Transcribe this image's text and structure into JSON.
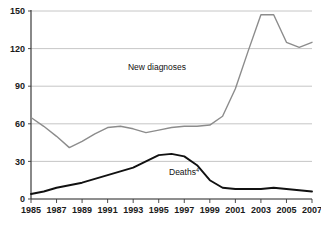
{
  "chart_data": {
    "type": "line",
    "title": "",
    "subtitle": "",
    "xlabel": "",
    "ylabel": "",
    "xlim": [
      1985,
      2007
    ],
    "ylim": [
      0,
      150
    ],
    "grid": true,
    "legend_position": "inline-annotations",
    "y_ticks": [
      0,
      30,
      60,
      90,
      120,
      150
    ],
    "y_tick_labels": [
      "0",
      "30",
      "60",
      "90",
      "120",
      "150"
    ],
    "x_ticks": [
      1985,
      1987,
      1989,
      1991,
      1993,
      1995,
      1997,
      1999,
      2001,
      2003,
      2005,
      2007
    ],
    "x_tick_labels": [
      "1985",
      "1987",
      "1989",
      "1991",
      "1993",
      "1995",
      "1997",
      "1999",
      "2001",
      "2003",
      "2005",
      "2007"
    ],
    "x": [
      1985,
      1986,
      1987,
      1988,
      1989,
      1990,
      1991,
      1992,
      1993,
      1994,
      1995,
      1996,
      1997,
      1998,
      1999,
      2000,
      2001,
      2002,
      2003,
      2004,
      2005,
      2006,
      2007
    ],
    "series": [
      {
        "name": "New diagnoses",
        "color": "#8c8c8c",
        "width": 1.4,
        "label_text": "New diagnoses",
        "label_sup": "",
        "label_x": 157,
        "label_y": 70,
        "values": [
          65,
          58,
          50,
          41,
          46,
          52,
          57,
          58,
          56,
          53,
          55,
          57,
          58,
          58,
          59,
          66,
          88,
          118,
          147,
          147,
          125,
          121,
          125
        ]
      },
      {
        "name": "Deaths",
        "color": "#111111",
        "width": 1.9,
        "label_text": "Deaths",
        "label_sup": "4",
        "label_x": 184,
        "label_y": 175,
        "values": [
          4,
          6,
          9,
          11,
          13,
          16,
          19,
          22,
          25,
          30,
          35,
          36,
          34,
          27,
          15,
          9,
          8,
          8,
          8,
          9,
          8,
          7,
          6
        ]
      }
    ],
    "colors": {
      "axis": "#3a3a3a",
      "grid": "#b8b8b8",
      "text": "#1a1a1a",
      "background": "#ffffff",
      "new_diagnoses": "#8c8c8c",
      "deaths": "#111111"
    },
    "geometry": {
      "plot_left": 31,
      "plot_right": 312,
      "plot_top": 11,
      "plot_bottom": 199
    }
  }
}
